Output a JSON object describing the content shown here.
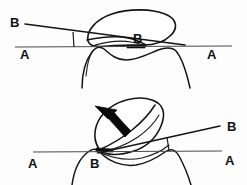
{
  "figure": {
    "background_color": "#fdfdfd",
    "ink_color": "#141414",
    "width": 247,
    "height": 185,
    "panels": [
      {
        "id": "upper-panel",
        "name": "upper-diagram",
        "description": "Tongue/soft-tissue outline resting on reference plane A-A with oblique plane B-B",
        "labels": [
          {
            "name": "label-b-upper-left",
            "text": "B",
            "x": 10,
            "y": 27
          },
          {
            "name": "label-a-upper-left",
            "text": "A",
            "x": 20,
            "y": 59
          },
          {
            "name": "label-b-upper-center",
            "text": "B",
            "x": 133,
            "y": 43
          },
          {
            "name": "label-a-upper-right",
            "text": "A",
            "x": 207,
            "y": 59
          }
        ],
        "lines": [
          {
            "name": "plane-aa-upper",
            "from": [
              15,
              47
            ],
            "to": [
              232,
              46
            ]
          },
          {
            "name": "plane-bb-upper",
            "from": [
              25,
              24
            ],
            "to": [
              185,
              45
            ]
          }
        ],
        "angle_tick": {
          "name": "angle-tick-upper",
          "from": [
            73,
            32
          ],
          "to": [
            74,
            47
          ]
        }
      },
      {
        "id": "lower-panel",
        "name": "lower-diagram",
        "description": "Rotated soft-tissue outline with curved rotation arrow; planes A-A and B-B meet at point B",
        "labels": [
          {
            "name": "label-a-lower-left",
            "text": "A",
            "x": 28,
            "y": 168
          },
          {
            "name": "label-b-lower-center",
            "text": "B",
            "x": 90,
            "y": 168
          },
          {
            "name": "label-b-lower-right",
            "text": "B",
            "x": 227,
            "y": 131
          },
          {
            "name": "label-a-lower-right",
            "text": "A",
            "x": 225,
            "y": 165
          }
        ],
        "lines": [
          {
            "name": "plane-aa-lower",
            "from": [
              33,
              152
            ],
            "to": [
              222,
              151
            ]
          },
          {
            "name": "plane-bb-lower",
            "from": [
              98,
              153
            ],
            "to": [
              220,
              126
            ]
          }
        ],
        "angle_tick": {
          "name": "angle-tick-lower",
          "from": [
            167,
            137
          ],
          "to": [
            169,
            151
          ]
        },
        "arrow": {
          "name": "rotation-arrow",
          "direction": "counter-clockwise-up-left",
          "tip": [
            97,
            108
          ],
          "tail": [
            122,
            133
          ]
        }
      }
    ]
  }
}
